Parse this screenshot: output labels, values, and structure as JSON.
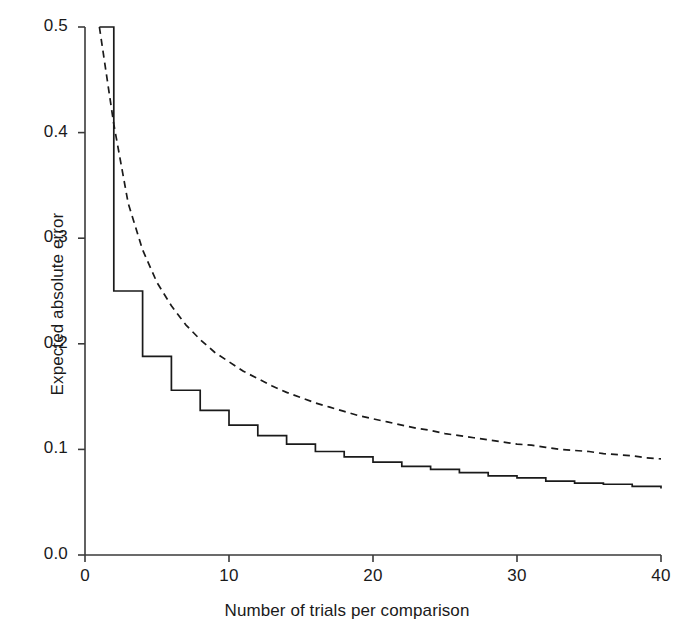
{
  "chart_data": {
    "type": "line",
    "title": "",
    "xlabel": "Number of trials per comparison",
    "ylabel": "Expected absolute error",
    "xlim": [
      0,
      40
    ],
    "ylim": [
      0.0,
      0.5
    ],
    "grid": false,
    "legend": null,
    "xticks": [
      0,
      10,
      20,
      30,
      40
    ],
    "xticklabels": [
      "0",
      "10",
      "20",
      "30",
      "40"
    ],
    "yticks": [
      0.0,
      0.1,
      0.2,
      0.3,
      0.4,
      0.5
    ],
    "yticklabels": [
      "0.0",
      "0.1",
      "0.2",
      "0.3",
      "0.4",
      "0.5"
    ],
    "x": [
      1,
      2,
      3,
      4,
      5,
      6,
      7,
      8,
      9,
      10,
      11,
      12,
      13,
      14,
      15,
      16,
      17,
      18,
      19,
      20,
      21,
      22,
      23,
      24,
      25,
      26,
      27,
      28,
      29,
      30,
      31,
      32,
      33,
      34,
      35,
      36,
      37,
      38,
      39,
      40
    ],
    "series": [
      {
        "name": "Exact expected absolute error",
        "style": "solid",
        "color": "#1a1a1a",
        "drawstyle": "steps-post",
        "values": [
          0.5,
          0.25,
          0.25,
          0.188,
          0.188,
          0.156,
          0.156,
          0.137,
          0.137,
          0.123,
          0.123,
          0.113,
          0.113,
          0.105,
          0.105,
          0.098,
          0.098,
          0.093,
          0.093,
          0.088,
          0.088,
          0.084,
          0.084,
          0.081,
          0.081,
          0.078,
          0.078,
          0.075,
          0.075,
          0.073,
          0.073,
          0.07,
          0.07,
          0.068,
          0.068,
          0.067,
          0.067,
          0.065,
          0.065,
          0.063
        ]
      },
      {
        "name": "Normal approximation",
        "style": "dashed",
        "color": "#1a1a1a",
        "drawstyle": "default",
        "values": [
          0.5,
          0.408,
          0.333,
          0.289,
          0.258,
          0.236,
          0.218,
          0.204,
          0.192,
          0.183,
          0.174,
          0.167,
          0.16,
          0.154,
          0.149,
          0.144,
          0.14,
          0.136,
          0.132,
          0.129,
          0.126,
          0.123,
          0.12,
          0.118,
          0.115,
          0.113,
          0.111,
          0.109,
          0.107,
          0.105,
          0.104,
          0.102,
          0.1,
          0.099,
          0.098,
          0.096,
          0.095,
          0.094,
          0.092,
          0.091
        ]
      }
    ]
  },
  "axis": {
    "ylabel": "Expected absolute error",
    "xlabel": "Number of trials per comparison",
    "ytick_labels": [
      "0.5",
      "0.4",
      "0.3",
      "0.2",
      "0.1",
      "0.0"
    ],
    "xtick_labels": [
      "0",
      "10",
      "20",
      "30",
      "40"
    ]
  },
  "colors": {
    "background": "#ffffff",
    "ink": "#1a1a1a",
    "axis": "#3a3a3a"
  }
}
